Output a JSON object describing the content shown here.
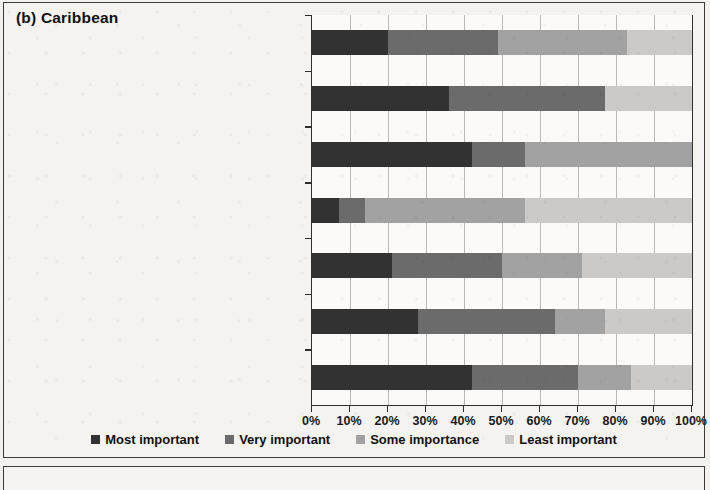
{
  "panel": {
    "title": "(b) Caribbean",
    "frame_color": "#3b3b3b",
    "background": "#f4f3f0"
  },
  "chart_data": {
    "type": "bar",
    "orientation": "horizontal",
    "stacked": true,
    "normalized_percent": true,
    "title": "(b) Caribbean",
    "xlabel": "",
    "ylabel": "",
    "xlim": [
      0,
      100
    ],
    "xticks": [
      0,
      10,
      20,
      30,
      40,
      50,
      60,
      70,
      80,
      90,
      100
    ],
    "xticklabels": [
      "0%",
      "10%",
      "20%",
      "30%",
      "40%",
      "50%",
      "60%",
      "70%",
      "80%",
      "90%",
      "100%"
    ],
    "grid": "vertical",
    "legend_position": "bottom",
    "categories": [
      "Institutional and governance issues",
      "Communication of warnings from the forecasters to the end users",
      "Uncertainty in the warnings",
      "Lack of relevance of the warnings to humanitarian response",
      "Lack of accessibility of the warnings",
      "Lack of technological capacity to generate forecasts",
      "Lack of high quality data"
    ],
    "series": [
      {
        "name": "Most important",
        "color": "#333232",
        "values": [
          20,
          36,
          42,
          7,
          21,
          28,
          42
        ]
      },
      {
        "name": "Very important",
        "color": "#6c6b6b",
        "values": [
          29,
          41,
          14,
          7,
          29,
          36,
          28
        ]
      },
      {
        "name": "Some importance",
        "color": "#a3a2a2",
        "values": [
          34,
          0,
          44,
          42,
          21,
          13,
          14
        ]
      },
      {
        "name": "Least important",
        "color": "#cbcac8",
        "values": [
          17,
          23,
          0,
          44,
          29,
          23,
          16
        ]
      }
    ]
  },
  "legend": {
    "items": [
      {
        "label": "Most important",
        "color": "#333232"
      },
      {
        "label": "Very important",
        "color": "#6c6b6b"
      },
      {
        "label": "Some importance",
        "color": "#a3a2a2"
      },
      {
        "label": "Least important",
        "color": "#cbcac8"
      }
    ]
  }
}
